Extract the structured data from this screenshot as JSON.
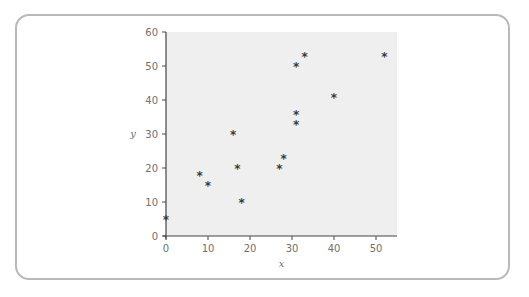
{
  "chart_data": {
    "type": "scatter",
    "title": "",
    "xlabel": "x",
    "ylabel": "y",
    "xlim": [
      0,
      55
    ],
    "ylim": [
      0,
      60
    ],
    "xticks": [
      0,
      10,
      20,
      30,
      40,
      50
    ],
    "yticks": [
      0,
      10,
      20,
      30,
      40,
      50,
      60
    ],
    "grid": false,
    "legend": null,
    "marker": "asterisk",
    "colors": {
      "plot_bg": "#efefef",
      "axis": "#444444",
      "marker": "#3a3a3a",
      "frame": "#b9b9b9",
      "text": "#6f6f6f"
    },
    "points": [
      {
        "x": 0,
        "y": 5
      },
      {
        "x": 8,
        "y": 18
      },
      {
        "x": 10,
        "y": 15
      },
      {
        "x": 16,
        "y": 30
      },
      {
        "x": 17,
        "y": 20
      },
      {
        "x": 18,
        "y": 10
      },
      {
        "x": 27,
        "y": 20
      },
      {
        "x": 28,
        "y": 23
      },
      {
        "x": 31,
        "y": 33
      },
      {
        "x": 31,
        "y": 36
      },
      {
        "x": 31,
        "y": 50
      },
      {
        "x": 33,
        "y": 53
      },
      {
        "x": 40,
        "y": 41
      },
      {
        "x": 52,
        "y": 53
      }
    ]
  }
}
